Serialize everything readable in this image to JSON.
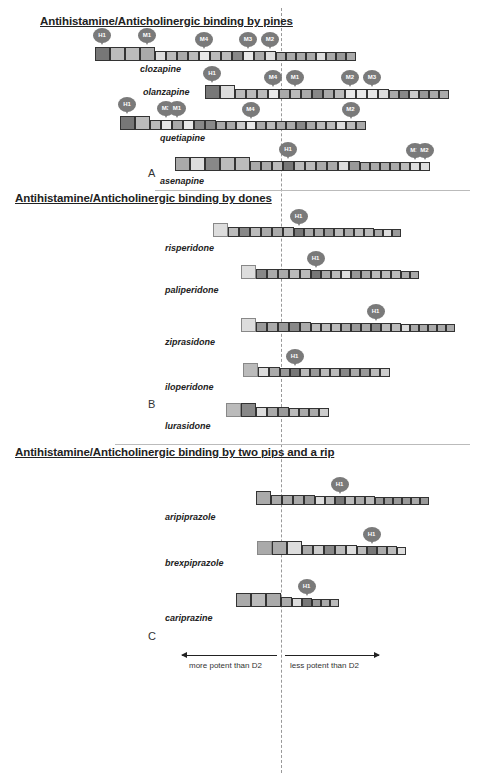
{
  "sections": [
    {
      "title": "Antihistamine/Anticholinergic binding by pines",
      "panel": "A"
    },
    {
      "title": "Antihistamine/Anticholinergic binding by dones",
      "panel": "B"
    },
    {
      "title": "Antihistamine/Anticholinergic binding by two pips and a rip",
      "panel": "C"
    }
  ],
  "axis": {
    "left_label": "more potent than D2",
    "right_label": "less potent than D2",
    "reference": "D2"
  },
  "drugs": [
    {
      "name": "clozapine",
      "section": 0,
      "boxes": [
        "L",
        "L",
        "L",
        "L",
        "M",
        "M",
        "M",
        "M",
        "M",
        "M",
        "M",
        "M",
        "M",
        "M",
        "M",
        "S",
        "S",
        "S",
        "S",
        "S",
        "S",
        "S",
        "S"
      ],
      "shades": [
        "#777",
        "#bbb",
        "#bbb",
        "#aaa",
        "#ddd",
        "#bbb",
        "#aaa",
        "#bbb",
        "#e8e8e8",
        "#bbb",
        "#bbb",
        "#888",
        "#e8e8e8",
        "#aaa",
        "#ddd",
        "#aaa",
        "#aaa",
        "#aaa",
        "#aaa",
        "#ddd",
        "#aaa",
        "#999",
        "#aaa"
      ],
      "receptors": [
        {
          "label": "H1",
          "box": 0
        },
        {
          "label": "M1",
          "box": 3
        },
        {
          "label": "M4",
          "box": 8
        },
        {
          "label": "M3",
          "box": 12
        },
        {
          "label": "M2",
          "box": 14
        }
      ]
    },
    {
      "name": "olanzapine",
      "section": 0,
      "boxes": [
        "L",
        "L",
        "M",
        "M",
        "M",
        "M",
        "M",
        "M",
        "M",
        "M",
        "M",
        "M",
        "M",
        "M",
        "M",
        "M",
        "S",
        "S",
        "S",
        "S",
        "S",
        "S"
      ],
      "shades": [
        "#777",
        "#ddd",
        "#bbb",
        "#bbb",
        "#bbb",
        "#e8e8e8",
        "#aaa",
        "#bbb",
        "#aaa",
        "#888",
        "#aaa",
        "#bbb",
        "#e8e8e8",
        "#e8e8e8",
        "#e8e8e8",
        "#ddd",
        "#aaa",
        "#888",
        "#ccc",
        "#999",
        "#aaa",
        "#aaa"
      ],
      "receptors": [
        {
          "label": "H1",
          "box": 0
        },
        {
          "label": "M4",
          "box": 5
        },
        {
          "label": "M1",
          "box": 7
        },
        {
          "label": "M2",
          "box": 12
        },
        {
          "label": "M3",
          "box": 14
        }
      ]
    },
    {
      "name": "quetiapine",
      "section": 0,
      "boxes": [
        "L",
        "L",
        "M",
        "M",
        "M",
        "M",
        "M",
        "M",
        "S",
        "S",
        "S",
        "S",
        "S",
        "S",
        "S",
        "S",
        "S",
        "S",
        "S",
        "S",
        "S",
        "S",
        "S"
      ],
      "shades": [
        "#777",
        "#bbb",
        "#bbb",
        "#e8e8e8",
        "#aaa",
        "#e8e8e8",
        "#888",
        "#888",
        "#aaa",
        "#aaa",
        "#ccc",
        "#e8e8e8",
        "#aaa",
        "#bbb",
        "#aaa",
        "#aaa",
        "#888",
        "#aaa",
        "#bbb",
        "#bbb",
        "#ddd",
        "#bbb",
        "#aaa"
      ],
      "receptors": [
        {
          "label": "H1",
          "box": 0
        },
        {
          "label": "M3",
          "box": 3
        },
        {
          "label": "M1",
          "box": 4
        },
        {
          "label": "M4",
          "box": 11
        },
        {
          "label": "M2",
          "box": 21
        }
      ]
    },
    {
      "name": "asenapine",
      "section": 0,
      "boxes": [
        "L",
        "L",
        "L",
        "L",
        "L",
        "M",
        "M",
        "M",
        "M",
        "M",
        "M",
        "M",
        "M",
        "M",
        "M",
        "S",
        "S",
        "S",
        "S",
        "S",
        "S",
        "S"
      ],
      "shades": [
        "#aaa",
        "#ddd",
        "#888",
        "#bbb",
        "#bbb",
        "#aaa",
        "#aaa",
        "#bbb",
        "#777",
        "#bbb",
        "#bbb",
        "#aaa",
        "#aaa",
        "#ddd",
        "#999",
        "#aaa",
        "#aaa",
        "#aaa",
        "#aaa",
        "#bbb",
        "#ddd",
        "#ddd"
      ],
      "receptors": [
        {
          "label": "H1",
          "box": 8
        },
        {
          "label": "M1",
          "box": 20
        },
        {
          "label": "M2",
          "box": 21
        }
      ]
    },
    {
      "name": "risperidone",
      "section": 1,
      "boxes": [
        "L",
        "M",
        "M",
        "M",
        "M",
        "M",
        "M",
        "S",
        "S",
        "S",
        "S",
        "S",
        "S",
        "S",
        "S",
        "T",
        "T",
        "T"
      ],
      "shades": [
        "#ddd",
        "#bbb",
        "#888",
        "#bbb",
        "#aaa",
        "#aaa",
        "#bbb",
        "#777",
        "#aaa",
        "#aaa",
        "#999",
        "#bbb",
        "#aaa",
        "#bbb",
        "#bbb",
        "#aaa",
        "#ddd",
        "#999"
      ],
      "receptors": [
        {
          "label": "H1",
          "box": 7
        }
      ]
    },
    {
      "name": "paliperidone",
      "section": 1,
      "boxes": [
        "L",
        "M",
        "M",
        "M",
        "M",
        "M",
        "S",
        "S",
        "S",
        "S",
        "S",
        "S",
        "S",
        "S",
        "S",
        "T",
        "T"
      ],
      "shades": [
        "#ddd",
        "#888",
        "#aaa",
        "#aaa",
        "#bbb",
        "#bbb",
        "#777",
        "#aaa",
        "#bbb",
        "#ddd",
        "#999",
        "#aaa",
        "#bbb",
        "#bbb",
        "#bbb",
        "#aaa",
        "#aaa"
      ],
      "receptors": [
        {
          "label": "H1",
          "box": 6
        }
      ]
    },
    {
      "name": "ziprasidone",
      "section": 1,
      "boxes": [
        "L",
        "M",
        "M",
        "M",
        "M",
        "M",
        "S",
        "S",
        "S",
        "S",
        "S",
        "S",
        "S",
        "S",
        "S",
        "T",
        "T",
        "T",
        "T",
        "T",
        "T"
      ],
      "shades": [
        "#ddd",
        "#999",
        "#aaa",
        "#999",
        "#888",
        "#aaa",
        "#bbb",
        "#bbb",
        "#bbb",
        "#aaa",
        "#999",
        "#aaa",
        "#888",
        "#bbb",
        "#bbb",
        "#ddd",
        "#aaa",
        "#aaa",
        "#aaa",
        "#aaa",
        "#aaa"
      ],
      "receptors": [
        {
          "label": "H1",
          "box": 12
        }
      ]
    },
    {
      "name": "iloperidone",
      "section": 1,
      "boxes": [
        "L",
        "M",
        "M",
        "S",
        "S",
        "S",
        "S",
        "S",
        "S",
        "S",
        "S",
        "S",
        "S",
        "S"
      ],
      "shades": [
        "#bbb",
        "#ddd",
        "#aaa",
        "#999",
        "#777",
        "#bbb",
        "#999",
        "#bbb",
        "#bbb",
        "#888",
        "#aaa",
        "#999",
        "#bbb",
        "#ccc"
      ],
      "receptors": [
        {
          "label": "H1",
          "box": 4
        }
      ]
    },
    {
      "name": "lurasidone",
      "section": 1,
      "boxes": [
        "L",
        "L",
        "M",
        "M",
        "M",
        "S",
        "S",
        "S",
        "S"
      ],
      "shades": [
        "#bbb",
        "#888",
        "#ddd",
        "#aaa",
        "#999",
        "#bbb",
        "#aaa",
        "#aaa",
        "#ccc"
      ],
      "receptors": []
    },
    {
      "name": "aripiprazole",
      "section": 2,
      "boxes": [
        "L",
        "M",
        "M",
        "M",
        "M",
        "S",
        "S",
        "S",
        "S",
        "S",
        "S",
        "T",
        "T",
        "T",
        "T",
        "T",
        "T"
      ],
      "shades": [
        "#aaa",
        "#aaa",
        "#aaa",
        "#aaa",
        "#999",
        "#ddd",
        "#bbb",
        "#777",
        "#bbb",
        "#aaa",
        "#bbb",
        "#999",
        "#999",
        "#999",
        "#999",
        "#aaa",
        "#999"
      ],
      "receptors": [
        {
          "label": "H1",
          "box": 7
        }
      ]
    },
    {
      "name": "brexpiprazole",
      "section": 2,
      "boxes": [
        "L",
        "L",
        "L",
        "M",
        "M",
        "M",
        "M",
        "M",
        "S",
        "S",
        "S",
        "S",
        "T"
      ],
      "shades": [
        "#aaa",
        "#aaa",
        "#ddd",
        "#aaa",
        "#ccc",
        "#888",
        "#bbb",
        "#ddd",
        "#bbb",
        "#777",
        "#aaa",
        "#bbb",
        "#ddd"
      ],
      "receptors": [
        {
          "label": "H1",
          "box": 9
        }
      ]
    },
    {
      "name": "cariprazine",
      "section": 2,
      "boxes": [
        "L",
        "L",
        "L",
        "M",
        "S",
        "S",
        "T",
        "T",
        "T"
      ],
      "shades": [
        "#aaa",
        "#bbb",
        "#aaa",
        "#aaa",
        "#ddd",
        "#777",
        "#999",
        "#aaa",
        "#bbb"
      ],
      "receptors": [
        {
          "label": "H1",
          "box": 5
        }
      ]
    }
  ]
}
